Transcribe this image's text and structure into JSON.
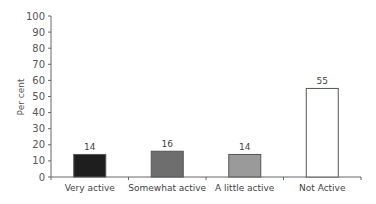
{
  "chart_data": {
    "type": "bar",
    "title": "",
    "xlabel": "",
    "ylabel": "Per cent",
    "ylim": [
      0,
      100
    ],
    "yticks": [
      0,
      10,
      20,
      30,
      40,
      50,
      60,
      70,
      80,
      90,
      100
    ],
    "grid": false,
    "legend": null,
    "categories": [
      "Very active",
      "Somewhat active",
      "A little active",
      "Not Active"
    ],
    "values": [
      14,
      16,
      14,
      55
    ],
    "bar_colors": [
      "#1e1e1e",
      "#6e6e6e",
      "#9a9a9a",
      "#ffffff"
    ],
    "data_labels": [
      "14",
      "16",
      "14",
      "55"
    ]
  }
}
